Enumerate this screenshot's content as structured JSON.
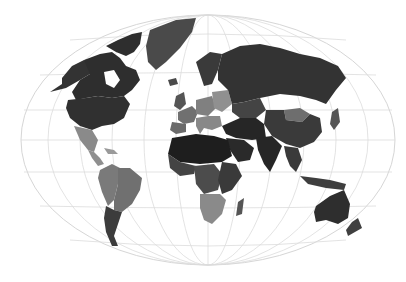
{
  "map": {
    "type": "choropleth",
    "projection": "winkel-tripel-like",
    "colorscale": "grayscale",
    "background": "#ffffff",
    "graticule_color": "#dcdcdc",
    "legend": null,
    "title": null,
    "regions": [
      {
        "name": "Canada",
        "shade": "#2e2e2e"
      },
      {
        "name": "Arctic Archipelago",
        "shade": "#2e2e2e"
      },
      {
        "name": "Alaska",
        "shade": "#333333"
      },
      {
        "name": "United States",
        "shade": "#303030"
      },
      {
        "name": "Greenland",
        "shade": "#4a4a4a"
      },
      {
        "name": "Iceland",
        "shade": "#4a4a4a"
      },
      {
        "name": "Mexico",
        "shade": "#8a8a8a"
      },
      {
        "name": "Central America",
        "shade": "#8f8f8f"
      },
      {
        "name": "Caribbean",
        "shade": "#9a9a9a"
      },
      {
        "name": "Brazil",
        "shade": "#707070"
      },
      {
        "name": "Andes (Peru/Bolivia/Colombia)",
        "shade": "#7a7a7a"
      },
      {
        "name": "Argentina/Chile",
        "shade": "#3c3c3c"
      },
      {
        "name": "Scandinavia",
        "shade": "#3a3a3a"
      },
      {
        "name": "UK/Ireland",
        "shade": "#555555"
      },
      {
        "name": "Western Europe",
        "shade": "#707070"
      },
      {
        "name": "Central Europe",
        "shade": "#808080"
      },
      {
        "name": "Eastern Europe",
        "shade": "#909090"
      },
      {
        "name": "Iberia",
        "shade": "#6a6a6a"
      },
      {
        "name": "Italy/Balkans",
        "shade": "#888888"
      },
      {
        "name": "Russia",
        "shade": "#333333"
      },
      {
        "name": "Kazakhstan/Central Asia",
        "shade": "#444444"
      },
      {
        "name": "Mongolia",
        "shade": "#6e6e6e"
      },
      {
        "name": "China",
        "shade": "#3a3a3a"
      },
      {
        "name": "Middle East",
        "shade": "#262626"
      },
      {
        "name": "Arabian Peninsula",
        "shade": "#2a2a2a"
      },
      {
        "name": "India/South Asia",
        "shade": "#262626"
      },
      {
        "name": "Southeast Asia",
        "shade": "#3a3a3a"
      },
      {
        "name": "Indonesia",
        "shade": "#3e3e3e"
      },
      {
        "name": "Japan",
        "shade": "#555555"
      },
      {
        "name": "North Africa / Sahara",
        "shade": "#1e1e1e"
      },
      {
        "name": "West Africa",
        "shade": "#444444"
      },
      {
        "name": "Central Africa",
        "shade": "#4c4c4c"
      },
      {
        "name": "East Africa",
        "shade": "#3a3a3a"
      },
      {
        "name": "Southern Africa",
        "shade": "#8a8a8a"
      },
      {
        "name": "Madagascar",
        "shade": "#555555"
      },
      {
        "name": "Australia",
        "shade": "#2e2e2e"
      },
      {
        "name": "New Zealand",
        "shade": "#404040"
      }
    ]
  }
}
